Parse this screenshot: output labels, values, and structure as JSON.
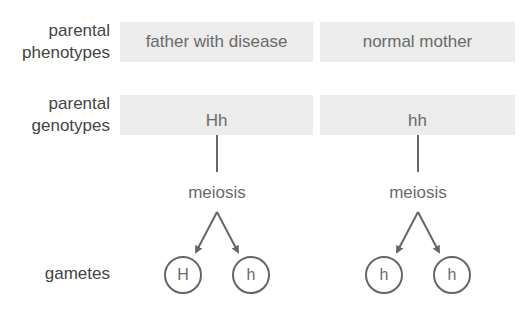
{
  "row_labels": {
    "phenotypes": [
      "parental",
      "phenotypes"
    ],
    "genotypes": [
      "parental",
      "genotypes"
    ],
    "gametes": "gametes"
  },
  "parents": [
    {
      "phenotype": "father with disease",
      "genotype": "Hh",
      "process": "meiosis",
      "gametes": [
        "H",
        "h"
      ]
    },
    {
      "phenotype": "normal mother",
      "genotype": "hh",
      "process": "meiosis",
      "gametes": [
        "h",
        "h"
      ]
    }
  ],
  "colors": {
    "box_fill": "#ececec",
    "line": "#666666",
    "text": "#6a6a6a"
  }
}
